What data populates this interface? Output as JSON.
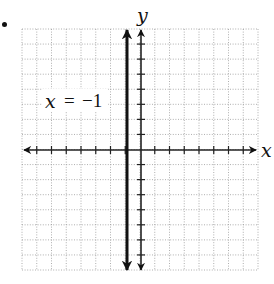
{
  "problem": {
    "marker": "bullet"
  },
  "graph": {
    "type": "coordinate-grid",
    "x_axis_label": "x",
    "y_axis_label": "y",
    "x_range": [
      -8,
      8
    ],
    "y_range": [
      -8,
      8
    ],
    "grid": true,
    "grid_style": "dotted",
    "tick_step": 1
  },
  "line": {
    "equation_var": "x",
    "equation_eq": "=",
    "equation_value": "−1",
    "equation": "x = −1",
    "x_value": -1,
    "orientation": "vertical",
    "color": "#111111"
  },
  "colors": {
    "axis": "#222222",
    "grid": "#9a9a9a",
    "background": "#ffffff"
  }
}
